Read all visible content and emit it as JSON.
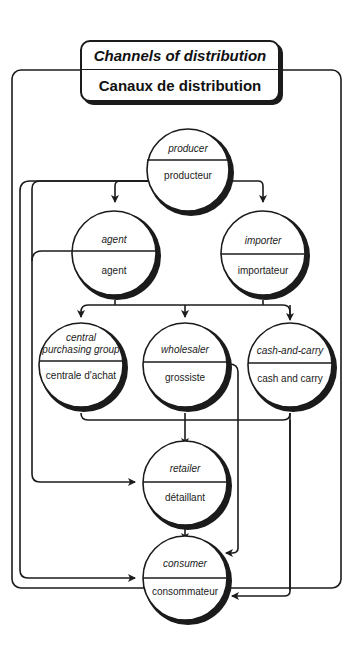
{
  "title": {
    "english": "Channels of distribution",
    "french": "Canaux de distribution"
  },
  "nodes": [
    {
      "id": "producer",
      "english": "producer",
      "french": "producteur"
    },
    {
      "id": "agent",
      "english": "agent",
      "french": "agent"
    },
    {
      "id": "importer",
      "english": "importer",
      "french": "importateur"
    },
    {
      "id": "central_purchasing_group",
      "english": "central purchasing group",
      "english_lines": [
        "central",
        "purchasing group"
      ],
      "french": "centrale d'achat"
    },
    {
      "id": "wholesaler",
      "english": "wholesaler",
      "french": "grossiste"
    },
    {
      "id": "cash_and_carry",
      "english": "cash-and-carry",
      "french": "cash and carry"
    },
    {
      "id": "retailer",
      "english": "retailer",
      "french": "détaillant"
    },
    {
      "id": "consumer",
      "english": "consumer",
      "french": "consommateur"
    }
  ],
  "edges": [
    {
      "from": "producer",
      "to": "agent"
    },
    {
      "from": "producer",
      "to": "importer"
    },
    {
      "from": "producer",
      "to": "retailer"
    },
    {
      "from": "producer",
      "to": "consumer"
    },
    {
      "from": "agent",
      "to": "central_purchasing_group"
    },
    {
      "from": "agent",
      "to": "wholesaler"
    },
    {
      "from": "agent",
      "to": "cash_and_carry"
    },
    {
      "from": "agent",
      "to": "retailer"
    },
    {
      "from": "importer",
      "to": "central_purchasing_group"
    },
    {
      "from": "importer",
      "to": "wholesaler"
    },
    {
      "from": "importer",
      "to": "cash_and_carry"
    },
    {
      "from": "central_purchasing_group",
      "to": "retailer"
    },
    {
      "from": "wholesaler",
      "to": "retailer"
    },
    {
      "from": "wholesaler",
      "to": "consumer"
    },
    {
      "from": "cash_and_carry",
      "to": "retailer"
    },
    {
      "from": "cash_and_carry",
      "to": "consumer"
    },
    {
      "from": "retailer",
      "to": "consumer"
    }
  ],
  "colors": {
    "line": "#1b1b1b",
    "background": "#ffffff",
    "text": "#222222"
  }
}
